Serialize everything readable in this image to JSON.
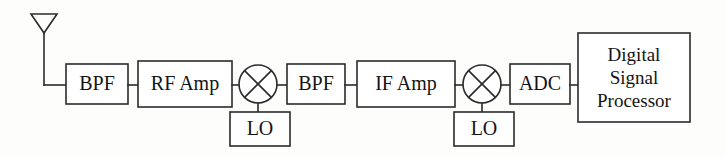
{
  "diagram": {
    "background_color": "#fdfdfc",
    "line_color": "#2b2b2b",
    "text_color": "#141414",
    "antenna": {
      "name": "antenna",
      "shape": "inverted-triangle"
    },
    "blocks": [
      {
        "id": "bpf1",
        "label": "BPF",
        "x": 66,
        "y": 64,
        "w": 62,
        "h": 40
      },
      {
        "id": "rfamp",
        "label": "RF Amp",
        "x": 138,
        "y": 61,
        "w": 94,
        "h": 46
      },
      {
        "id": "mixer1",
        "label": "",
        "cx": 258,
        "cy": 84,
        "r": 19,
        "shape": "mixer"
      },
      {
        "id": "lo1",
        "label": "LO",
        "x": 230,
        "y": 112,
        "w": 60,
        "h": 34
      },
      {
        "id": "bpf2",
        "label": "BPF",
        "x": 287,
        "y": 64,
        "w": 58,
        "h": 40
      },
      {
        "id": "ifamp",
        "label": "IF Amp",
        "x": 357,
        "y": 61,
        "w": 98,
        "h": 46
      },
      {
        "id": "mixer2",
        "label": "",
        "cx": 482,
        "cy": 84,
        "r": 19,
        "shape": "mixer"
      },
      {
        "id": "lo2",
        "label": "LO",
        "x": 454,
        "y": 112,
        "w": 60,
        "h": 34
      },
      {
        "id": "adc",
        "label": "ADC",
        "x": 510,
        "y": 64,
        "w": 60,
        "h": 40
      },
      {
        "id": "dsp",
        "label": "Digital Signal Processor",
        "x": 578,
        "y": 33,
        "w": 112,
        "h": 89
      }
    ],
    "dsp_lines": [
      "Digital",
      "Signal",
      "Processor"
    ],
    "signal_flow": [
      "antenna",
      "BPF",
      "RF Amp",
      "mixer (LO)",
      "BPF",
      "IF Amp",
      "mixer (LO)",
      "ADC",
      "Digital Signal Processor"
    ]
  }
}
